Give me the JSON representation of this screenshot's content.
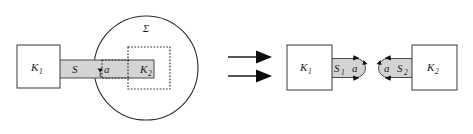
{
  "figure": {
    "background_color": "#ffffff",
    "band_fill": "#d4d4d4",
    "stroke_color": "#2b2b2b",
    "left_panel": {
      "name": "before-decomposition",
      "boxes": [
        {
          "id": "k1",
          "label": "K",
          "subscript": "1",
          "style": "solid"
        },
        {
          "id": "k2",
          "label": "K",
          "subscript": "2",
          "style": "dashed"
        }
      ],
      "band": {
        "id": "s",
        "label": "S"
      },
      "interface": {
        "id": "a",
        "label": "a"
      },
      "region": {
        "id": "sigma",
        "label": "Σ",
        "shape": "circle"
      }
    },
    "transition": {
      "name": "double-arrow",
      "arrow_count": 2,
      "direction": "right"
    },
    "right_panel": {
      "name": "after-decomposition",
      "part_one": {
        "box": {
          "id": "k1",
          "label": "K",
          "subscript": "1",
          "style": "solid"
        },
        "band": {
          "id": "s1",
          "label": "S",
          "subscript": "1"
        },
        "interface": {
          "id": "a",
          "label": "a"
        }
      },
      "part_two": {
        "box": {
          "id": "k2",
          "label": "K",
          "subscript": "2",
          "style": "solid"
        },
        "band": {
          "id": "s2",
          "label": "S",
          "subscript": "2"
        },
        "interface": {
          "id": "a",
          "label": "a"
        }
      }
    }
  }
}
